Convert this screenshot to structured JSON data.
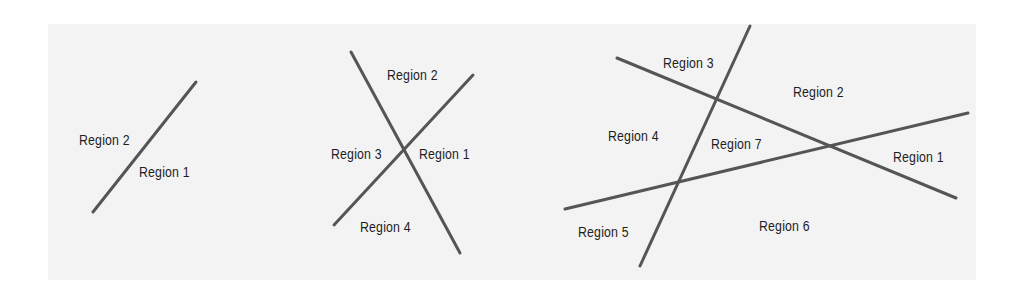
{
  "figure": {
    "background_color": "#f3f3f3",
    "line_color": "#555555",
    "text_color": "#1e1e1e",
    "panels": [
      {
        "id": "one-line",
        "lines": [
          {
            "x1": 196,
            "y1": 82,
            "x2": 93,
            "y2": 212
          }
        ],
        "labels": [
          {
            "text": "Region 2",
            "x": 79,
            "y": 132
          },
          {
            "text": "Region 1",
            "x": 139,
            "y": 164
          }
        ]
      },
      {
        "id": "two-lines",
        "lines": [
          {
            "x1": 351,
            "y1": 52,
            "x2": 460,
            "y2": 253
          },
          {
            "x1": 473,
            "y1": 75,
            "x2": 334,
            "y2": 225
          }
        ],
        "labels": [
          {
            "text": "Region 2",
            "x": 387,
            "y": 67
          },
          {
            "text": "Region 3",
            "x": 331,
            "y": 146
          },
          {
            "text": "Region 1",
            "x": 419,
            "y": 146
          },
          {
            "text": "Region 4",
            "x": 360,
            "y": 219
          }
        ]
      },
      {
        "id": "three-lines",
        "lines": [
          {
            "x1": 750,
            "y1": 26,
            "x2": 640,
            "y2": 266
          },
          {
            "x1": 617,
            "y1": 58,
            "x2": 956,
            "y2": 198
          },
          {
            "x1": 565,
            "y1": 209,
            "x2": 968,
            "y2": 113
          }
        ],
        "labels": [
          {
            "text": "Region 3",
            "x": 663,
            "y": 55
          },
          {
            "text": "Region 2",
            "x": 793,
            "y": 84
          },
          {
            "text": "Region 4",
            "x": 608,
            "y": 128
          },
          {
            "text": "Region 7",
            "x": 711,
            "y": 136
          },
          {
            "text": "Region 1",
            "x": 893,
            "y": 149
          },
          {
            "text": "Region 5",
            "x": 578,
            "y": 224
          },
          {
            "text": "Region 6",
            "x": 759,
            "y": 218
          }
        ]
      }
    ]
  }
}
